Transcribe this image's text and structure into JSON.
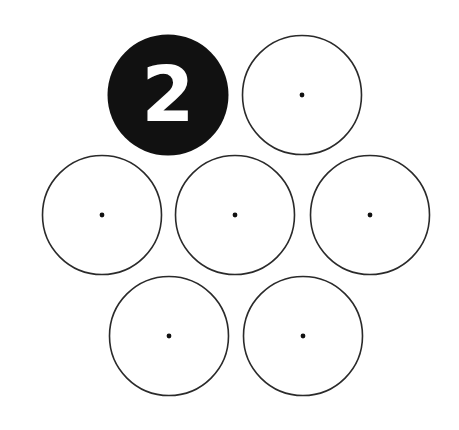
{
  "diagram": {
    "type": "hexagonal circle cluster",
    "colors": {
      "background": "#ffffff",
      "stroke": "#2a2a2a",
      "filled": "#111111",
      "number_text": "#ffffff"
    },
    "circles": [
      {
        "id": "top-left",
        "cx": 168,
        "cy": 95,
        "filled": true,
        "label": "2"
      },
      {
        "id": "top-right",
        "cx": 302,
        "cy": 95,
        "filled": false,
        "label": ""
      },
      {
        "id": "middle-left",
        "cx": 102,
        "cy": 215,
        "filled": false,
        "label": ""
      },
      {
        "id": "middle-center",
        "cx": 235,
        "cy": 215,
        "filled": false,
        "label": ""
      },
      {
        "id": "middle-right",
        "cx": 370,
        "cy": 215,
        "filled": false,
        "label": ""
      },
      {
        "id": "bottom-left",
        "cx": 169,
        "cy": 336,
        "filled": false,
        "label": ""
      },
      {
        "id": "bottom-right",
        "cx": 303,
        "cy": 336,
        "filled": false,
        "label": ""
      }
    ],
    "radius": 59.5
  }
}
